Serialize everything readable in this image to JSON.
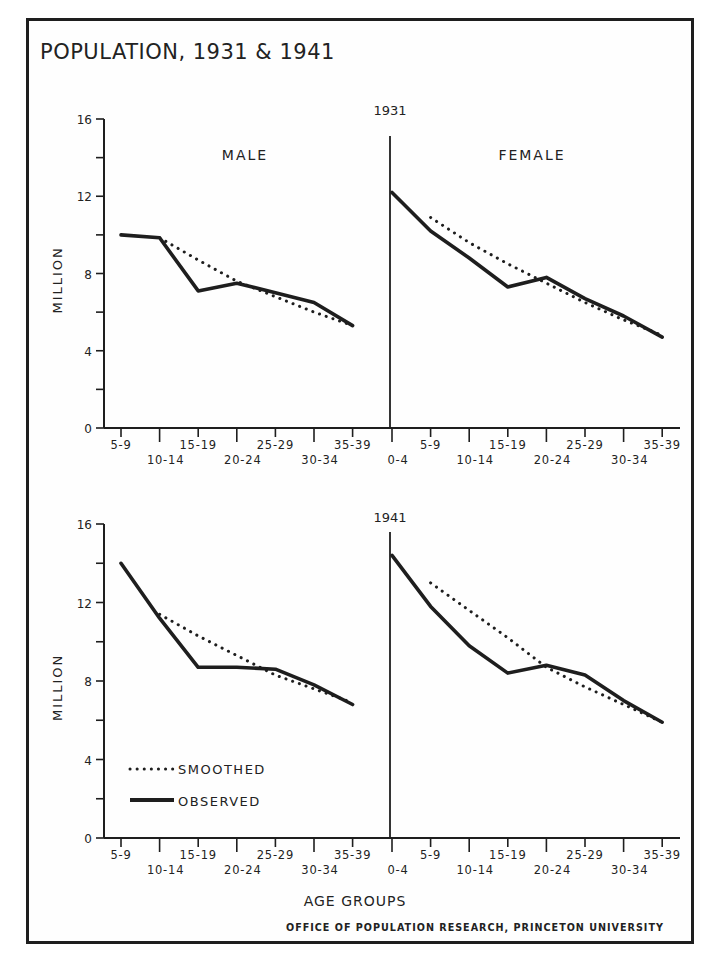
{
  "title": "POPULATION, 1931 & 1941",
  "credit": "OFFICE OF POPULATION RESEARCH, PRINCETON UNIVERSITY",
  "xlabel": "AGE GROUPS",
  "ylabel": "MILLION",
  "legend": {
    "smoothed": "SMOOTHED",
    "observed": "OBSERVED"
  },
  "colors": {
    "ink": "#1e1e1e",
    "paper": "#fefefe"
  },
  "chart_data": [
    {
      "type": "line",
      "title": "1931",
      "panel": "top",
      "xlabel": "AGE GROUPS",
      "ylabel": "MILLION",
      "ylim": [
        0,
        16
      ],
      "yticks": [
        0,
        4,
        8,
        12,
        16
      ],
      "grid": false,
      "subplots": [
        {
          "label": "MALE",
          "categories": [
            "5-9",
            "10-14",
            "15-19",
            "20-24",
            "25-29",
            "30-34",
            "35-39"
          ],
          "series": [
            {
              "name": "OBSERVED",
              "style": "solid",
              "values": [
                10.0,
                9.85,
                7.1,
                7.5,
                7.0,
                6.5,
                5.3
              ]
            },
            {
              "name": "SMOOTHED",
              "style": "dotted",
              "values": [
                null,
                9.85,
                8.7,
                7.6,
                6.8,
                6.0,
                5.3
              ]
            }
          ]
        },
        {
          "label": "FEMALE",
          "categories": [
            "0-4",
            "5-9",
            "10-14",
            "15-19",
            "20-24",
            "25-29",
            "30-34",
            "35-39"
          ],
          "series": [
            {
              "name": "OBSERVED",
              "style": "solid",
              "values": [
                12.2,
                10.2,
                8.8,
                7.3,
                7.8,
                6.7,
                5.8,
                4.7
              ]
            },
            {
              "name": "SMOOTHED",
              "style": "dotted",
              "values": [
                null,
                10.9,
                9.6,
                8.5,
                7.5,
                6.5,
                5.6,
                4.8
              ]
            }
          ]
        }
      ]
    },
    {
      "type": "line",
      "title": "1941",
      "panel": "bottom",
      "xlabel": "AGE GROUPS",
      "ylabel": "MILLION",
      "ylim": [
        0,
        16
      ],
      "yticks": [
        0,
        4,
        8,
        12,
        16
      ],
      "grid": false,
      "legend_position": "lower-left",
      "subplots": [
        {
          "label": "",
          "categories": [
            "5-9",
            "10-14",
            "15-19",
            "20-24",
            "25-29",
            "30-34",
            "35-39"
          ],
          "series": [
            {
              "name": "OBSERVED",
              "style": "solid",
              "values": [
                14.0,
                11.2,
                8.7,
                8.7,
                8.6,
                7.8,
                6.8
              ]
            },
            {
              "name": "SMOOTHED",
              "style": "dotted",
              "values": [
                null,
                11.4,
                10.3,
                9.3,
                8.3,
                7.6,
                6.9
              ]
            }
          ]
        },
        {
          "label": "",
          "categories": [
            "0-4",
            "5-9",
            "10-14",
            "15-19",
            "20-24",
            "25-29",
            "30-34",
            "35-39"
          ],
          "series": [
            {
              "name": "OBSERVED",
              "style": "solid",
              "values": [
                14.4,
                11.8,
                9.8,
                8.4,
                8.8,
                8.3,
                7.0,
                5.9
              ]
            },
            {
              "name": "SMOOTHED",
              "style": "dotted",
              "values": [
                null,
                13.0,
                11.6,
                10.2,
                8.7,
                7.7,
                6.8,
                5.9
              ]
            }
          ]
        }
      ]
    }
  ]
}
